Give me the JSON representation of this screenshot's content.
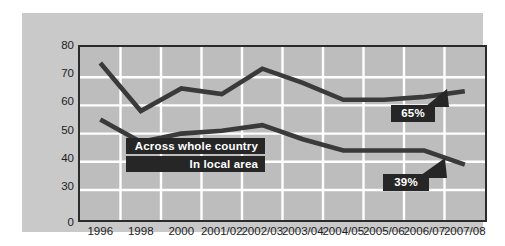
{
  "chart_data": {
    "type": "line",
    "title": "",
    "subtitle": "",
    "xlabel": "",
    "ylabel": "",
    "categories": [
      "1996",
      "1998",
      "2000",
      "2001/02",
      "2002/03",
      "2003/04",
      "2004/05",
      "2005/06",
      "2006/07",
      "2007/08"
    ],
    "ylim": [
      25,
      80
    ],
    "yticks": [
      "80",
      "70",
      "60",
      "50",
      "40",
      "30",
      "0"
    ],
    "ytick_values": [
      80,
      70,
      60,
      50,
      40,
      30,
      25
    ],
    "grid": true,
    "legend_position": "inside-center-left",
    "series": [
      {
        "name": "Across whole country",
        "values": [
          75,
          58,
          66,
          64,
          73,
          68,
          62,
          62,
          63,
          65
        ],
        "color": "#3a3a3a"
      },
      {
        "name": "In local area",
        "values": [
          55,
          47,
          50,
          51,
          53,
          48,
          44,
          44,
          44,
          39
        ],
        "color": "#3a3a3a"
      }
    ],
    "annotations": [
      {
        "text": "65%",
        "series": "Across whole country",
        "category": "2007/08",
        "value": 65
      },
      {
        "text": "39%",
        "series": "In local area",
        "category": "2007/08",
        "value": 39
      }
    ],
    "colors": {
      "panel_background": "#c9c9c9",
      "plot_background": "#bdbdbd",
      "gridline": "#ffffff",
      "axis_border": "#2b2b2b",
      "line": "#3a3a3a",
      "label_box": "#262626",
      "label_text": "#ffffff",
      "tick_text": "#1d1d1d"
    }
  }
}
